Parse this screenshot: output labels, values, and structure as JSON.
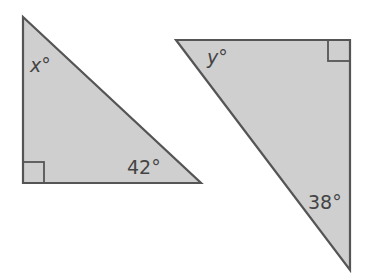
{
  "colors": {
    "fill": "#cfcfcf",
    "stroke": "#555555",
    "text": "#444444"
  },
  "triangles": [
    {
      "id": "left",
      "vertices": [
        [
          23,
          17
        ],
        [
          23,
          183
        ],
        [
          201,
          183
        ]
      ],
      "right_angle_at": "bottom-left",
      "right_angle_marker": {
        "x": 23,
        "y": 162,
        "w": 21,
        "h": 21
      },
      "labels": [
        {
          "text": "x°",
          "angle_at": "top",
          "x": 30,
          "y": 72,
          "italic": true
        },
        {
          "text": "42°",
          "angle_at": "bottom-right",
          "x": 127,
          "y": 174,
          "italic": false
        }
      ]
    },
    {
      "id": "right",
      "vertices": [
        [
          176,
          40
        ],
        [
          350,
          40
        ],
        [
          350,
          270
        ]
      ],
      "right_angle_at": "top-right",
      "right_angle_marker": {
        "x": 328,
        "y": 40,
        "w": 22,
        "h": 21
      },
      "labels": [
        {
          "text": "y°",
          "angle_at": "top-left",
          "x": 207,
          "y": 64,
          "italic": true
        },
        {
          "text": "38°",
          "angle_at": "bottom",
          "x": 308,
          "y": 209,
          "italic": false
        }
      ]
    }
  ]
}
